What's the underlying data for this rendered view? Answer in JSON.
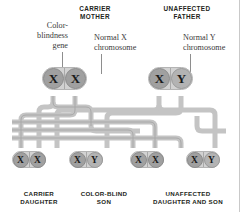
{
  "diagram": {
    "colors": {
      "capsule_fill": "#d2d2d2",
      "capsule_border": "#b4b4b4",
      "disc_fill": "#a0a0a0",
      "disc_pale_fill": "#b3b3b3",
      "pipe": "#c4c4c4",
      "pipe_shadow": "#a8a8a8",
      "text": "#231f20",
      "callout_text": "#3b3b3b",
      "frame_line": "#c9c9c9"
    }
  },
  "headings": {
    "mother": "CARRIER\nMOTHER",
    "mother_line1": "CARRIER",
    "mother_line2": "MOTHER",
    "father_line1": "UNAFFECTED",
    "father_line2": "FATHER"
  },
  "callouts": [
    {
      "id": "color-blindness-gene",
      "line1": "Color-",
      "line2": "blindness",
      "line3": "gene",
      "align": "right"
    },
    {
      "id": "normal-x-chromosome",
      "line1": "Normal X",
      "line2": "chromosome",
      "align": "left"
    },
    {
      "id": "normal-y-chromosome",
      "line1": "Normal Y",
      "line2": "chromosome",
      "align": "left"
    }
  ],
  "parents": [
    {
      "id": "carrier-mother",
      "label": "CARRIER MOTHER",
      "alleles": [
        {
          "symbol": "X",
          "type": "affected-x",
          "pale": false
        },
        {
          "symbol": "X",
          "type": "normal-x",
          "pale": false
        }
      ]
    },
    {
      "id": "unaffected-father",
      "label": "UNAFFECTED FATHER",
      "alleles": [
        {
          "symbol": "X",
          "type": "normal-x",
          "pale": false
        },
        {
          "symbol": "Y",
          "type": "normal-y",
          "pale": true
        }
      ]
    }
  ],
  "offspring": [
    {
      "id": "carrier-daughter",
      "caption_line1": "CARRIER",
      "caption_line2": "DAUGHTER",
      "alleles": [
        {
          "symbol": "X",
          "pale": false
        },
        {
          "symbol": "X",
          "pale": false
        }
      ]
    },
    {
      "id": "color-blind-son",
      "caption_line1": "COLOR-BLIND",
      "caption_line2": "SON",
      "alleles": [
        {
          "symbol": "X",
          "pale": false
        },
        {
          "symbol": "Y",
          "pale": true
        }
      ]
    },
    {
      "id": "unaffected-daughter",
      "caption_line1": "UNAFFECTED",
      "caption_line2": "DAUGHTER AND SON",
      "alleles": [
        {
          "symbol": "X",
          "pale": false
        },
        {
          "symbol": "X",
          "pale": false
        }
      ]
    },
    {
      "id": "unaffected-son",
      "caption_line1": "",
      "caption_line2": "",
      "alleles": [
        {
          "symbol": "X",
          "pale": false
        },
        {
          "symbol": "Y",
          "pale": true
        }
      ]
    }
  ],
  "captions": [
    {
      "line1": "CARRIER",
      "line2": "DAUGHTER"
    },
    {
      "line1": "COLOR-BLIND",
      "line2": "SON"
    },
    {
      "line1": "UNAFFECTED",
      "line2": "DAUGHTER AND SON"
    }
  ]
}
